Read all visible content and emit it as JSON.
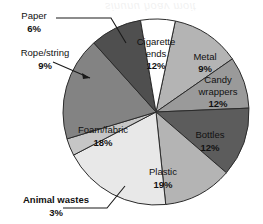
{
  "chart_data": {
    "type": "pie",
    "title": "",
    "subtitle": "",
    "xlabel": "",
    "ylabel": "",
    "units": "percent",
    "total": 100,
    "start_angle_deg": 12,
    "direction": "clockwise",
    "legend": "none",
    "grid": false,
    "categories": [
      "Cigarette ends",
      "Metal",
      "Candy wrappers",
      "Bottles",
      "Plastic",
      "Animal wastes",
      "Foam/fabric",
      "Rope/string",
      "Paper"
    ],
    "values": [
      12,
      9,
      12,
      12,
      19,
      3,
      18,
      9,
      6
    ],
    "slices": [
      {
        "label": "Cigarette ends",
        "value": 12,
        "value_text": "12%",
        "color": "#b4b4b4",
        "label_placement": "inside",
        "label_lines": [
          "Cigarette",
          "ends"
        ]
      },
      {
        "label": "Metal",
        "value": 9,
        "value_text": "9%",
        "color": "#9a9a9a",
        "label_placement": "inside",
        "label_lines": [
          "Metal"
        ]
      },
      {
        "label": "Candy wrappers",
        "value": 12,
        "value_text": "12%",
        "color": "#5c5c5c",
        "label_placement": "inside",
        "label_lines": [
          "Candy",
          "wrappers"
        ]
      },
      {
        "label": "Bottles",
        "value": 12,
        "value_text": "12%",
        "color": "#b4b4b4",
        "label_placement": "inside",
        "label_lines": [
          "Bottles"
        ]
      },
      {
        "label": "Plastic",
        "value": 19,
        "value_text": "19%",
        "color": "#e8e8e8",
        "label_placement": "inside",
        "label_lines": [
          "Plastic"
        ]
      },
      {
        "label": "Animal wastes",
        "value": 3,
        "value_text": "3%",
        "color": "#c6c6c6",
        "label_placement": "outside",
        "label_lines": [
          "Animal wastes"
        ]
      },
      {
        "label": "Foam/fabric",
        "value": 18,
        "value_text": "18%",
        "color": "#838383",
        "label_placement": "inside",
        "label_lines": [
          "Foam/fabric"
        ]
      },
      {
        "label": "Rope/string",
        "value": 9,
        "value_text": "9%",
        "color": "#4f4f4f",
        "label_placement": "outside",
        "label_lines": [
          "Rope/string"
        ]
      },
      {
        "label": "Paper",
        "value": 6,
        "value_text": "6%",
        "color": "#ffffff",
        "label_placement": "outside",
        "label_lines": [
          "Paper"
        ]
      }
    ]
  },
  "labels": {
    "cigarette_ends": {
      "line1": "Cigarette",
      "line2": "ends",
      "pct": "12%"
    },
    "metal": {
      "line1": "Metal",
      "pct": "9%"
    },
    "candy_wrappers": {
      "line1": "Candy",
      "line2": "wrappers",
      "pct": "12%"
    },
    "bottles": {
      "line1": "Bottles",
      "pct": "12%"
    },
    "plastic": {
      "line1": "Plastic",
      "pct": "19%"
    },
    "foam_fabric": {
      "line1": "Foam/fabric",
      "pct": "18%"
    },
    "animal_wastes": {
      "line1": "Animal wastes",
      "pct": "3%"
    },
    "rope_string": {
      "line1": "Rope/string",
      "pct": "9%"
    },
    "paper": {
      "line1": "Paper",
      "pct": "6%"
    }
  },
  "geometry": {
    "center_x": 156,
    "center_y": 112,
    "radius": 93
  },
  "colors": {
    "outline": "#2b2b2b",
    "text": "#111111",
    "background": "#ffffff"
  }
}
